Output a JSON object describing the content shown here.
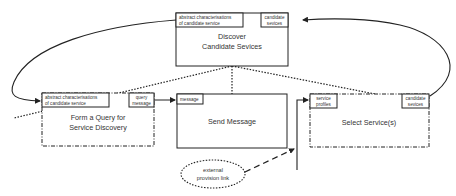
{
  "diagram": {
    "type": "process-flow",
    "nodes": {
      "discover": {
        "title_line1": "Discover",
        "title_line2": "Candidate Sevices",
        "input_port_line1": "abstract characterisations",
        "input_port_line2": "of candidate service",
        "output_port_line1": "candidate",
        "output_port_line2": "sevices",
        "border": "solid"
      },
      "form_query": {
        "title_line1": "Form a Query for",
        "title_line2": "Service Discovery",
        "input_port_line1": "abstract characterisations",
        "input_port_line2": "of candidate service",
        "output_port_line1": "query",
        "output_port_line2": "message",
        "border": "dash-dot"
      },
      "send_message": {
        "title": "Send Message",
        "input_port": "message",
        "border": "solid"
      },
      "select_services": {
        "title": "Select Service(s)",
        "input_port_line1": "service",
        "input_port_line2": "profiles",
        "output_port_line1": "candidate",
        "output_port_line2": "sevices",
        "border": "dash-dot"
      },
      "external_link": {
        "line1": "external",
        "line2": "provision link",
        "shape": "dotted-ellipse"
      }
    },
    "edges": [
      {
        "from": "select_services.candidate_sevices",
        "to": "discover.candidate_sevices",
        "style": "solid-arc"
      },
      {
        "from": "discover.abstract_characterisations",
        "to": "form_query.abstract_characterisations",
        "style": "solid-arc"
      },
      {
        "from": "form_query.query_message",
        "to": "send_message.message",
        "style": "solid"
      },
      {
        "from": "send_message",
        "to": "select_services.service_profiles",
        "style": "solid-elbow"
      },
      {
        "from": "external_link",
        "to": "send_to_select_edge",
        "style": "dashed"
      },
      {
        "from": "discover",
        "to": "form_query",
        "style": "dotted"
      },
      {
        "from": "discover",
        "to": "send_message",
        "style": "dotted"
      },
      {
        "from": "discover",
        "to": "select_services",
        "style": "dotted"
      }
    ],
    "colors": {
      "stroke": "#222222",
      "text": "#333333",
      "background": "#ffffff"
    }
  }
}
